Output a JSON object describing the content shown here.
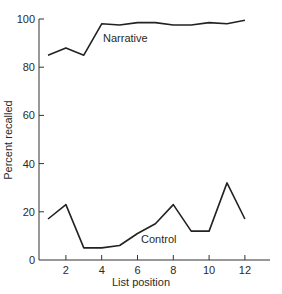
{
  "chart_data": {
    "type": "line",
    "title": "",
    "xlabel": "List position",
    "ylabel": "Percent recalled",
    "x": [
      1,
      2,
      3,
      4,
      5,
      6,
      7,
      8,
      9,
      10,
      11,
      12
    ],
    "xticks": [
      2,
      4,
      6,
      8,
      10,
      12
    ],
    "yticks": [
      0,
      20,
      40,
      60,
      80,
      100
    ],
    "xlim": [
      0.5,
      13
    ],
    "ylim": [
      0,
      100
    ],
    "grid": false,
    "legend_position": "inline labels",
    "series": [
      {
        "name": "Narrative",
        "values": [
          85,
          88,
          85,
          98,
          97.5,
          98.5,
          98.5,
          97.5,
          97.5,
          98.5,
          98,
          99.5
        ]
      },
      {
        "name": "Control",
        "values": [
          17,
          23,
          5,
          5,
          6,
          11,
          15,
          23,
          12,
          12,
          32,
          17
        ]
      }
    ],
    "annotations": [
      {
        "text": "Narrative",
        "near_series": "Narrative"
      },
      {
        "text": "Control",
        "near_series": "Control"
      }
    ]
  }
}
